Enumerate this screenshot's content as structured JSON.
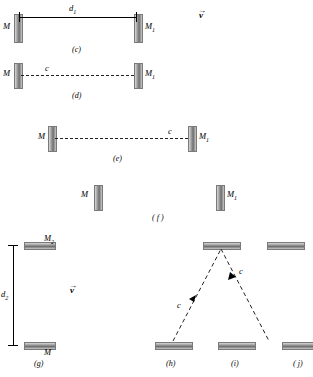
{
  "figure": {
    "panels": [
      {
        "id": "c",
        "label": "(c)"
      },
      {
        "id": "d",
        "label": "(d)"
      },
      {
        "id": "e",
        "label": "(e)"
      },
      {
        "id": "f",
        "label": "( f )"
      },
      {
        "id": "g",
        "label": "(g)"
      },
      {
        "id": "h",
        "label": "(h)"
      },
      {
        "id": "i",
        "label": "(i)"
      },
      {
        "id": "j",
        "label": "( j)"
      }
    ],
    "labels": {
      "mirror_M": "M",
      "mirror_M1": "M",
      "mirror_M1_sub": "1",
      "mirror_M2": "M",
      "mirror_M2_sub": "2",
      "distance_d1": "d",
      "distance_d1_sub": "1",
      "distance_d2": "d",
      "distance_d2_sub": "2",
      "photon_c": "c",
      "velocity_v": "v"
    }
  },
  "panel_c": {
    "left_mirror_label": "M",
    "right_mirror_label": "M",
    "right_mirror_sub": "1",
    "dimension_label": "d",
    "dimension_sub": "1",
    "velocity_label": "v",
    "caption": "(c)"
  },
  "panel_d": {
    "left_mirror_label": "M",
    "right_mirror_label": "M",
    "right_mirror_sub": "1",
    "photon_label": "c",
    "caption": "(d)"
  },
  "panel_e": {
    "left_mirror_label": "M",
    "right_mirror_label": "M",
    "right_mirror_sub": "1",
    "photon_label": "c",
    "caption": "(e)"
  },
  "panel_f": {
    "left_mirror_label": "M",
    "right_mirror_label": "M",
    "right_mirror_sub": "1",
    "caption": "( f )"
  },
  "panel_g": {
    "top_mirror_label": "M",
    "top_mirror_sub": "2",
    "bottom_mirror_label": "M",
    "dimension_label": "d",
    "dimension_sub": "2",
    "velocity_label": "v",
    "caption": "(g)"
  },
  "panel_h": {
    "photon_label": "c",
    "caption": "(h)"
  },
  "panel_i": {
    "photon_label": "c",
    "caption": "(i)"
  },
  "panel_j": {
    "caption": "( j)"
  }
}
